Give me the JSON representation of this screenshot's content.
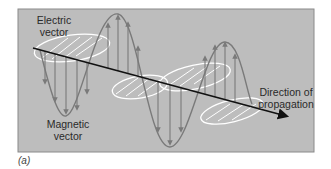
{
  "figure": {
    "panel_label": "(a)",
    "background_color": "#bdbdbd",
    "frame_color": "#8a8a8a",
    "labels": {
      "electric": [
        "Electric",
        "vector"
      ],
      "magnetic": [
        "Magnetic",
        "vector"
      ],
      "direction": [
        "Direction of",
        "propagation"
      ]
    },
    "colors": {
      "axis": "#111111",
      "electric_wave": "#7a7a7a",
      "magnetic_wave": "#ffffff"
    }
  }
}
